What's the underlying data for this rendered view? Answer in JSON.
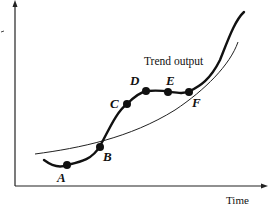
{
  "figure": {
    "trend_label": "Trend output",
    "x_axis_label": "Time",
    "y_axis_label": "",
    "points": [
      {
        "id": "A",
        "label": "A"
      },
      {
        "id": "B",
        "label": "B"
      },
      {
        "id": "C",
        "label": "C"
      },
      {
        "id": "D",
        "label": "D"
      },
      {
        "id": "E",
        "label": "E"
      },
      {
        "id": "F",
        "label": "F"
      }
    ],
    "colors": {
      "line": "#111111",
      "background": "#ffffff"
    }
  }
}
